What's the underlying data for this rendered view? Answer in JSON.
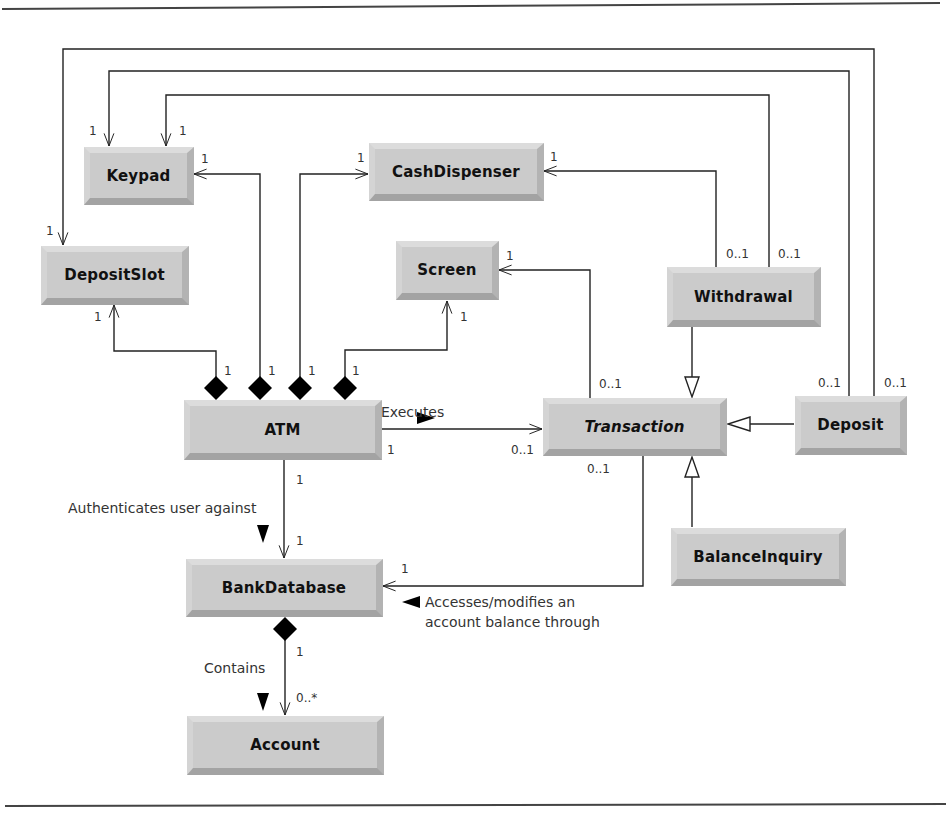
{
  "classes": {
    "keypad": {
      "name": "Keypad"
    },
    "cash_dispenser": {
      "name": "CashDispenser"
    },
    "deposit_slot": {
      "name": "DepositSlot"
    },
    "screen": {
      "name": "Screen"
    },
    "withdrawal": {
      "name": "Withdrawal"
    },
    "atm": {
      "name": "ATM"
    },
    "transaction": {
      "name": "Transaction",
      "abstract": true
    },
    "deposit": {
      "name": "Deposit"
    },
    "balance_inquiry": {
      "name": "BalanceInquiry"
    },
    "bank_database": {
      "name": "BankDatabase"
    },
    "account": {
      "name": "Account"
    }
  },
  "associations": {
    "executes": {
      "label": "Executes",
      "direction": "right"
    },
    "authenticates": {
      "label": "Authenticates user against",
      "direction": "down"
    },
    "accesses_line1": "Accesses/modifies an",
    "accesses_line2": "account balance through",
    "contains": {
      "label": "Contains",
      "direction": "down"
    }
  },
  "multiplicities": {
    "keypad_from_withdrawal": "1",
    "keypad_from_deposit": "1",
    "keypad_from_atm": "1",
    "cash_dispenser_from_atm": "1",
    "cash_dispenser_from_withdrawal": "1",
    "deposit_slot_from_deposit": "1",
    "deposit_slot_from_atm": "1",
    "screen_from_atm": "1",
    "screen_from_transaction": "1",
    "atm_deposit_slot_end": "1",
    "atm_keypad_end": "1",
    "atm_cash_dispenser_end": "1",
    "atm_screen_end": "1",
    "withdrawal_cash_dispenser": "0..1",
    "withdrawal_keypad": "0..1",
    "transaction_screen": "0..1",
    "deposit_keypad": "0..1",
    "deposit_deposit_slot": "0..1",
    "atm_executes": "1",
    "transaction_executes": "0..1",
    "transaction_bank_database": "0..1",
    "atm_bank_database": "1",
    "bank_database_from_atm": "1",
    "bank_database_from_transaction": "1",
    "bank_database_contains": "1",
    "account_contains": "0..*"
  },
  "colors": {
    "class_face": "#cbcbcb",
    "line": "#222222",
    "text": "#111111"
  }
}
